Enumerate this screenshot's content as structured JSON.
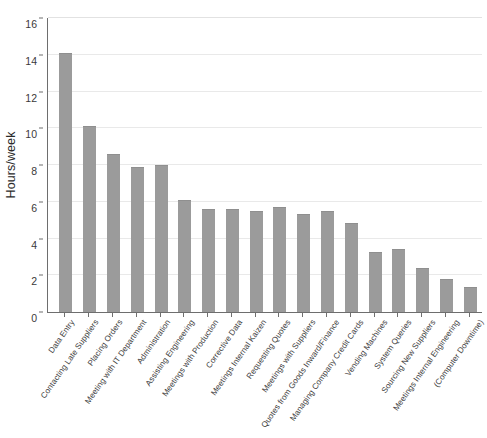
{
  "chart_data": {
    "type": "bar",
    "title": "",
    "xlabel": "",
    "ylabel": "Hours/week",
    "ylim": [
      0,
      16
    ],
    "ytick_step": 2,
    "yticks": [
      0,
      2,
      4,
      6,
      8,
      10,
      12,
      14,
      16
    ],
    "grid": true,
    "legend": null,
    "bar_color": "#9b9b9b",
    "gridline_color": "#e9e9e9",
    "axis_color": "#6e6e6e",
    "categories": [
      "Data Entry",
      "Contacting Late Suppliers",
      "Placing Orders",
      "Meeting with IT Department",
      "Administration",
      "Assisting Engineering",
      "Meetings with Production",
      "Corrective Data",
      "Meetings Internal Kaizen",
      "Requesting Quotes",
      "Meetings with Suppliers",
      "Quotes from Goods Inward/Finance",
      "Managing Company Credit Cards",
      "Vending Machines",
      "System Queries",
      "Sourcing New Suppliers",
      "Meetings Internal Engineering",
      "(Computer Downtime)"
    ],
    "values": [
      14.1,
      10.1,
      8.6,
      7.9,
      8.0,
      6.1,
      5.6,
      5.6,
      5.5,
      5.7,
      5.35,
      5.5,
      4.85,
      3.25,
      3.45,
      2.4,
      1.8,
      1.35
    ]
  }
}
